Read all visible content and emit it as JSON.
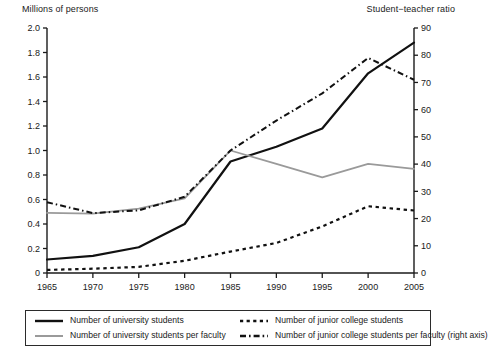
{
  "chart_data": {
    "type": "line",
    "title": "",
    "xlabel": "",
    "ylabel": "Millions of persons",
    "y2label": "Student−teacher ratio",
    "grid": false,
    "legend_position": "bottom",
    "x": [
      1965,
      1970,
      1975,
      1980,
      1985,
      1990,
      1995,
      2000,
      2005
    ],
    "xticklabels": [
      "1965",
      "1970",
      "1975",
      "1980",
      "1985",
      "1990",
      "1995",
      "2000",
      "2005"
    ],
    "ylim": [
      0,
      2.0
    ],
    "yticks": [
      0,
      0.2,
      0.4,
      0.6,
      0.8,
      1.0,
      1.2,
      1.4,
      1.6,
      1.8,
      2.0
    ],
    "yticklabels": [
      "0",
      "0.2",
      "0.4",
      "0.6",
      "0.8",
      "1.0",
      "1.2",
      "1.4",
      "1.6",
      "1.8",
      "2.0"
    ],
    "y2lim": [
      0,
      90
    ],
    "y2ticks": [
      0,
      10,
      20,
      30,
      40,
      50,
      60,
      70,
      80,
      90
    ],
    "y2ticklabels": [
      "0",
      "10",
      "20",
      "30",
      "40",
      "50",
      "60",
      "70",
      "80",
      "90"
    ],
    "series": [
      {
        "name": "Number of university students",
        "axis": "left",
        "style": "solid",
        "color": "#111111",
        "width": 2.2,
        "values": [
          0.11,
          0.14,
          0.21,
          0.4,
          0.91,
          1.03,
          1.18,
          1.63,
          1.88
        ]
      },
      {
        "name": "Number of university students per faculty",
        "axis": "left",
        "style": "solid",
        "color": "#9a9a9a",
        "width": 1.8,
        "values": [
          0.49,
          0.485,
          0.525,
          0.61,
          1.0,
          0.89,
          0.78,
          0.89,
          0.85
        ]
      },
      {
        "name": "Number of junior college students",
        "axis": "left",
        "style": "dotted",
        "color": "#111111",
        "width": 2.2,
        "values": [
          0.025,
          0.035,
          0.05,
          0.1,
          0.175,
          0.245,
          0.38,
          0.545,
          0.51
        ]
      },
      {
        "name": "Number of junior college students per faculty (right axis)",
        "axis": "right",
        "style": "dashdot",
        "color": "#111111",
        "width": 2.0,
        "values": [
          26,
          22,
          23,
          28,
          45,
          56,
          66,
          79,
          71
        ]
      }
    ]
  },
  "axes": {
    "left_title": "Millions of persons",
    "right_title": "Student−teacher ratio"
  },
  "legend": {
    "items": [
      {
        "label": "Number of university students",
        "swatch": "solid-black-line-swatch"
      },
      {
        "label": "Number of junior college students",
        "swatch": "dotted-black-line-swatch"
      },
      {
        "label": "Number of university students per faculty",
        "swatch": "solid-grey-line-swatch"
      },
      {
        "label": "Number of junior college students per faculty (right axis)",
        "swatch": "dashdot-black-line-swatch"
      }
    ]
  }
}
